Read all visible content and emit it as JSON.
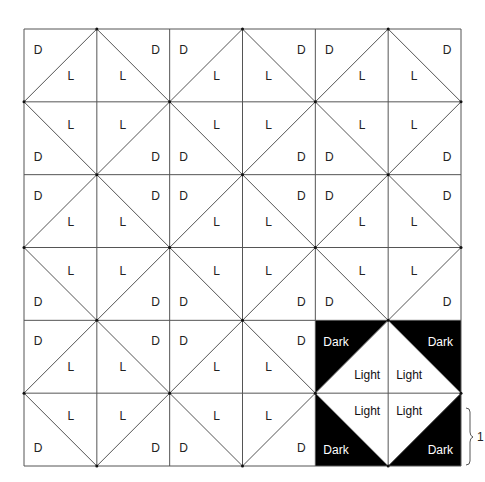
{
  "diagram": {
    "title": "",
    "grid": {
      "rows": 6,
      "cols": 6,
      "left": 24,
      "top": 29,
      "size": 437
    },
    "colors": {
      "line": "#555555",
      "dark": "#000000",
      "light": "#ffffff",
      "dot": "#111111"
    },
    "cell_labels": {
      "dark_short": "D",
      "light_short": "L",
      "dark_long": "Dark",
      "light_long": "Light"
    },
    "highlight_block": {
      "row": 4,
      "col": 4,
      "span": 2
    },
    "brace": {
      "label": "1"
    }
  }
}
